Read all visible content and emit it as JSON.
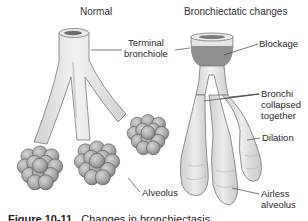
{
  "titles": {
    "normal": "Normal",
    "bronchiectatic": "Bronchiectatic changes"
  },
  "labels": {
    "terminal_bronchiole_line1": "Terminal",
    "terminal_bronchiole_line2": "bronchiole",
    "blockage": "Blockage",
    "bronchi_line1": "Bronchi",
    "bronchi_line2": "collapsed",
    "bronchi_line3": "together",
    "dilation": "Dilation",
    "alveolus": "Alveolus",
    "airless_line1": "Airless",
    "airless_line2": "alveolus"
  },
  "caption": {
    "figure_number": "Figure 10-11",
    "text": "Changes in bronchiectasis."
  },
  "colors": {
    "tube": "#e6e6e6",
    "outline": "#6e6e6e",
    "blockage": "#8f8f8f",
    "alveolus": "#a9a9a9"
  }
}
